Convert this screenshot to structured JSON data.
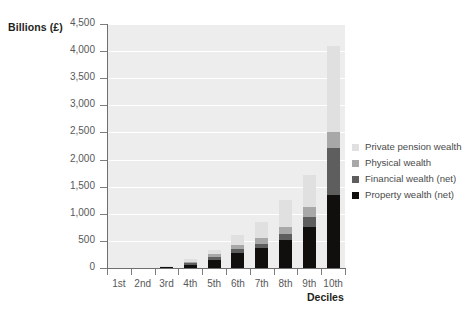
{
  "chart_data": {
    "type": "bar",
    "stacked": true,
    "title": "",
    "subtitle": "",
    "xlabel": "Deciles",
    "ylabel": "Billions (£)",
    "categories": [
      "1st",
      "2nd",
      "3rd",
      "4th",
      "5th",
      "6th",
      "7th",
      "8th",
      "9th",
      "10th"
    ],
    "ylim": [
      0,
      4500
    ],
    "yticks": [
      0,
      500,
      1000,
      1500,
      2000,
      2500,
      3000,
      3500,
      4000,
      4500
    ],
    "ytick_labels": [
      "0",
      "500",
      "1,000",
      "1,500",
      "2,000",
      "2,500",
      "3,000",
      "3,500",
      "4,000",
      "4,500"
    ],
    "grid": true,
    "legend_position": "right",
    "series": [
      {
        "name": "Property wealth (net)",
        "color": "#100f0d",
        "values": [
          0,
          0,
          10,
          60,
          150,
          280,
          370,
          520,
          760,
          1340
        ]
      },
      {
        "name": "Financial wealth (net)",
        "color": "#5e5e5e",
        "values": [
          0,
          0,
          5,
          25,
          45,
          65,
          80,
          110,
          180,
          880
        ]
      },
      {
        "name": "Physical wealth",
        "color": "#a8a8a8",
        "values": [
          0,
          0,
          10,
          35,
          55,
          75,
          95,
          120,
          180,
          290
        ]
      },
      {
        "name": "Private pension wealth",
        "color": "#e0e0e0",
        "values": [
          0,
          0,
          5,
          40,
          85,
          190,
          310,
          500,
          600,
          1590
        ]
      }
    ],
    "totals": [
      0,
      0,
      30,
      160,
      335,
      610,
      855,
      1250,
      1720,
      4100
    ]
  },
  "legend": {
    "items": [
      {
        "label": "Private pension wealth",
        "color": "#e0e0e0"
      },
      {
        "label": "Physical wealth",
        "color": "#a8a8a8"
      },
      {
        "label": "Financial wealth (net)",
        "color": "#5e5e5e"
      },
      {
        "label": "Property wealth (net)",
        "color": "#100f0d"
      }
    ]
  },
  "theme": {
    "plot_background": "#ededed",
    "gridline_color": "#ffffff",
    "axis_color": "#6f6f6f",
    "tick_text_color": "#58585a",
    "title_text_color": "#231f20"
  }
}
